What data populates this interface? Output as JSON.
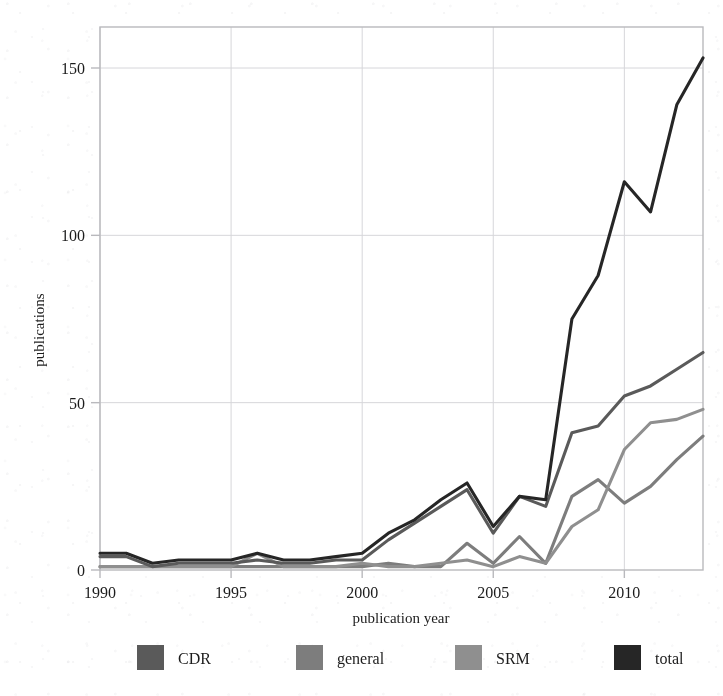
{
  "chart_data": {
    "type": "line",
    "title": "",
    "xlabel": "publication year",
    "ylabel": "publications",
    "xlim": [
      1990,
      2013
    ],
    "ylim": [
      0,
      160
    ],
    "xticks": [
      1990,
      1995,
      2000,
      2005,
      2010
    ],
    "yticks": [
      0,
      50,
      100,
      150
    ],
    "grid": true,
    "legend_position": "below",
    "x": [
      1990,
      1991,
      1992,
      1993,
      1994,
      1995,
      1996,
      1997,
      1998,
      1999,
      2000,
      2001,
      2002,
      2003,
      2004,
      2005,
      2006,
      2007,
      2008,
      2009,
      2010,
      2011,
      2012,
      2013
    ],
    "series": [
      {
        "name": "CDR",
        "color": "#5a5a5a",
        "values": [
          4,
          4,
          1,
          2,
          2,
          2,
          3,
          2,
          2,
          3,
          3,
          9,
          14,
          19,
          24,
          11,
          22,
          19,
          41,
          43,
          52,
          55,
          60,
          65
        ]
      },
      {
        "name": "general",
        "color": "#7d7d7d",
        "values": [
          1,
          1,
          1,
          1,
          1,
          1,
          1,
          1,
          1,
          1,
          1,
          2,
          1,
          1,
          8,
          2,
          10,
          2,
          22,
          27,
          20,
          25,
          33,
          40
        ]
      },
      {
        "name": "SRM",
        "color": "#8f8f8f",
        "values": [
          1,
          1,
          1,
          1,
          1,
          1,
          5,
          1,
          1,
          1,
          2,
          1,
          1,
          2,
          3,
          1,
          4,
          2,
          13,
          18,
          36,
          44,
          45,
          48
        ]
      },
      {
        "name": "total",
        "color": "#262626",
        "values": [
          5,
          5,
          2,
          3,
          3,
          3,
          5,
          3,
          3,
          4,
          5,
          11,
          15,
          21,
          26,
          13,
          22,
          21,
          75,
          88,
          116,
          107,
          139,
          153
        ]
      }
    ]
  },
  "legend": {
    "items": [
      {
        "label": "CDR",
        "color": "#5a5a5a"
      },
      {
        "label": "general",
        "color": "#7d7d7d"
      },
      {
        "label": "SRM",
        "color": "#8f8f8f"
      },
      {
        "label": "total",
        "color": "#262626"
      }
    ]
  },
  "axes": {
    "x_title": "publication year",
    "y_title": "publications",
    "x_tick_labels": [
      "1990",
      "1995",
      "2000",
      "2005",
      "2010"
    ],
    "y_tick_labels": [
      "0",
      "50",
      "100",
      "150"
    ]
  },
  "colors": {
    "plot_border": "#b9b9bd",
    "gridline": "#d6d6da",
    "background": "#ffffff",
    "text": "#1c1c1c"
  }
}
